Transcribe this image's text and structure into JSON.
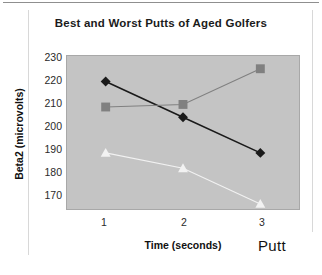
{
  "chart_data": {
    "type": "line",
    "title": "Best and Worst Putts of Aged Golfers",
    "xlabel": "Time (seconds)",
    "ylabel": "Beta2 (microvolts)",
    "x": [
      1,
      2,
      3
    ],
    "categories": [
      "1",
      "2",
      "3"
    ],
    "xlim": [
      0.5,
      3.5
    ],
    "ylim": [
      170,
      230
    ],
    "yticks": [
      170,
      180,
      190,
      200,
      210,
      220,
      230
    ],
    "ytick_labels": [
      "170",
      "180",
      "190",
      "200",
      "210",
      "220",
      "230"
    ],
    "xtick_labels": [
      "1",
      "2",
      "3"
    ],
    "grid": false,
    "legend_position": "bottom-right",
    "legend_title": "Putt",
    "plot_background": "#c4c4c4",
    "series": [
      {
        "name": "best-putt-series",
        "marker": "diamond",
        "color": "#1a1a1a",
        "values": [
          220,
          206,
          192
        ]
      },
      {
        "name": "worst-putt-series",
        "marker": "square",
        "color": "#808080",
        "values": [
          210,
          211,
          225
        ]
      },
      {
        "name": "third-series",
        "marker": "triangle",
        "color": "#f2f2f2",
        "values": [
          192,
          186,
          172
        ]
      }
    ]
  },
  "chart": {
    "title": "Best and Worst Putts of Aged Golfers",
    "x_axis_title": "Time (seconds)",
    "y_axis_title": "Beta2 (microvolts)",
    "legend_label": "Putt",
    "y_labels": {
      "t230": "230",
      "t220": "220",
      "t210": "210",
      "t200": "200",
      "t190": "190",
      "t180": "180",
      "t170": "170"
    },
    "x_labels": {
      "t1": "1",
      "t2": "2",
      "t3": "3"
    }
  }
}
